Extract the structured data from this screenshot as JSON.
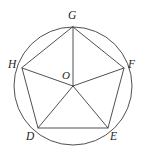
{
  "figure": {
    "background_color": "#ffffff",
    "stroke_color": "#3c3c3c",
    "label_color": "#1d1d1d",
    "canvas": {
      "width": 147,
      "height": 152
    },
    "circle": {
      "name": "circumscribed-circle",
      "cx": 73,
      "cy": 86,
      "r": 59
    },
    "center": {
      "label": "O",
      "x": 73,
      "y": 86,
      "label_x": 62,
      "label_y": 70
    },
    "vertices": [
      {
        "label": "G",
        "x": 73,
        "y": 27,
        "angle_deg": 90,
        "label_x": 68,
        "label_y": 10
      },
      {
        "label": "F",
        "x": 124,
        "y": 68,
        "angle_deg": 18,
        "label_x": 128,
        "label_y": 59
      },
      {
        "label": "E",
        "x": 108,
        "y": 128,
        "angle_deg": -54,
        "label_x": 110,
        "label_y": 131
      },
      {
        "label": "D",
        "x": 38,
        "y": 128,
        "angle_deg": -126,
        "label_x": 26,
        "label_y": 131
      },
      {
        "label": "H",
        "x": 22,
        "y": 68,
        "angle_deg": 162,
        "label_x": 8,
        "label_y": 59
      }
    ],
    "polygon_path": "M 73 27 L 124 68 L 108 128 L 38 128 L 22 68 Z",
    "radii": [
      {
        "name": "radius-O-G",
        "x1": 73,
        "y1": 86,
        "x2": 73,
        "y2": 27
      },
      {
        "name": "radius-O-F",
        "x1": 73,
        "y1": 86,
        "x2": 124,
        "y2": 68
      },
      {
        "name": "radius-O-E",
        "x1": 73,
        "y1": 86,
        "x2": 108,
        "y2": 128
      },
      {
        "name": "radius-O-D",
        "x1": 73,
        "y1": 86,
        "x2": 38,
        "y2": 128
      },
      {
        "name": "radius-O-H",
        "x1": 73,
        "y1": 86,
        "x2": 22,
        "y2": 68
      }
    ]
  }
}
